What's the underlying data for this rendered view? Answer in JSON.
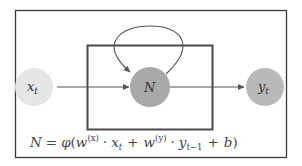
{
  "diagram": {
    "colors": {
      "background": "#ffffff",
      "outer_border": "#3a3a3a",
      "inner_box": "#4a4a4a",
      "edges": "#555555",
      "input_node": "#e6e6e6",
      "hidden_node": "#a9a9a9",
      "output_node": "#b9b9b9"
    },
    "nodes": [
      {
        "id": "x_t",
        "label": "x",
        "subscript": "t",
        "role": "input"
      },
      {
        "id": "N",
        "label": "N",
        "subscript": "",
        "role": "hidden"
      },
      {
        "id": "y_t",
        "label": "y",
        "subscript": "t",
        "role": "output"
      }
    ],
    "edges": [
      {
        "from": "x_t",
        "to": "N",
        "type": "arrow"
      },
      {
        "from": "N",
        "to": "y_t",
        "type": "arrow"
      },
      {
        "from": "N",
        "to": "N",
        "type": "self-loop"
      }
    ],
    "formula": {
      "text": "N = φ(w^(x) · x_t + w^(y) · y_{t−1} + b)",
      "lhs": "N",
      "eq": "=",
      "phi": "φ",
      "open": "(",
      "w1": "w",
      "w1_sup": "(x)",
      "dot1": "·",
      "x": "x",
      "x_sub": "t",
      "plus1": "+",
      "w2": "w",
      "w2_sup": "(y)",
      "dot2": "·",
      "y": "y",
      "y_sub": "t−1",
      "plus2": "+",
      "b": "b",
      "close": ")"
    }
  }
}
